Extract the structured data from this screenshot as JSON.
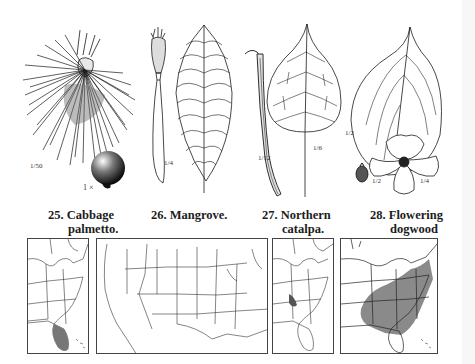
{
  "page": {
    "type": "field-guide-plate",
    "background": "#ffffff",
    "ink_color": "#1a1a1a",
    "range_shading_color": "#8a8a8a"
  },
  "species": [
    {
      "number": "25.",
      "name_line1": "Cabbage",
      "name_line2": "palmetto.",
      "scales": [
        "1/50",
        "1 ×"
      ],
      "illustrations": [
        "fan-leaf",
        "fruit"
      ]
    },
    {
      "number": "26.",
      "name_line1": "Mangrove.",
      "name_line2": "",
      "scales": [
        "1/4",
        "1/4"
      ],
      "illustrations": [
        "seedling-propagule",
        "leaf"
      ]
    },
    {
      "number": "27.",
      "name_line1": "Northern",
      "name_line2": "catalpa.",
      "scales": [
        "1/12",
        "1/6"
      ],
      "illustrations": [
        "seed-pod",
        "heart-shaped-leaf"
      ]
    },
    {
      "number": "28.",
      "name_line1": "Flowering",
      "name_line2": "dogwood",
      "scales": [
        "1/2",
        "1/2",
        "1/4"
      ],
      "illustrations": [
        "leaf",
        "flower",
        "fruit"
      ]
    }
  ],
  "maps": [
    {
      "label": "Cabbage palmetto range",
      "region": "eastern-us",
      "shaded": "Florida and Georgia/Carolina coast"
    },
    {
      "label": "Mangrove range",
      "region": "continental-us",
      "shaded": "southern Florida tip"
    },
    {
      "label": "Northern catalpa range",
      "region": "eastern-us",
      "shaded": "lower Ohio/Mississippi valleys"
    },
    {
      "label": "Flowering dogwood range",
      "region": "eastern-us",
      "shaded": "most of eastern US"
    }
  ]
}
